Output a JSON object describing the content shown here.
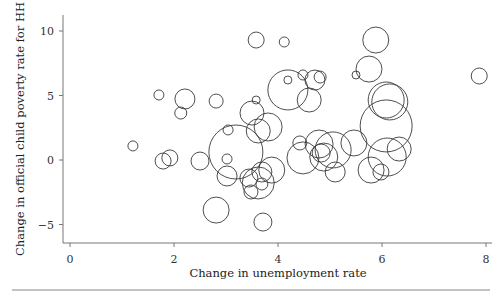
{
  "chart_data": {
    "type": "scatter",
    "subtype": "bubble",
    "title": "",
    "xlabel": "Change in unemployment rate",
    "ylabel": "Change in official child poverty rate for HH",
    "xlim": [
      -0.1,
      8.1
    ],
    "ylim": [
      -6.5,
      11
    ],
    "xticks": [
      0,
      2,
      4,
      6,
      8
    ],
    "yticks": [
      -5,
      0,
      5,
      10
    ],
    "grid": false,
    "legend": null,
    "points": [
      {
        "x": 1.21,
        "y": 1.09,
        "r": 5
      },
      {
        "x": 1.71,
        "y": 5.04,
        "r": 5
      },
      {
        "x": 2.21,
        "y": 4.73,
        "r": 10
      },
      {
        "x": 2.13,
        "y": 3.64,
        "r": 6
      },
      {
        "x": 2.81,
        "y": 4.57,
        "r": 7
      },
      {
        "x": 1.79,
        "y": -0.08,
        "r": 8
      },
      {
        "x": 1.92,
        "y": 0.16,
        "r": 8
      },
      {
        "x": 2.5,
        "y": -0.08,
        "r": 9
      },
      {
        "x": 2.81,
        "y": -3.88,
        "r": 13
      },
      {
        "x": 3.02,
        "y": 0.08,
        "r": 5
      },
      {
        "x": 3.02,
        "y": -1.24,
        "r": 10
      },
      {
        "x": 3.04,
        "y": 2.33,
        "r": 5
      },
      {
        "x": 3.19,
        "y": 0.62,
        "r": 27
      },
      {
        "x": 3.62,
        "y": 2.25,
        "r": 12
      },
      {
        "x": 3.5,
        "y": 3.64,
        "r": 12
      },
      {
        "x": 3.58,
        "y": 4.65,
        "r": 4
      },
      {
        "x": 3.58,
        "y": 9.3,
        "r": 8
      },
      {
        "x": 4.12,
        "y": 9.15,
        "r": 5
      },
      {
        "x": 4.19,
        "y": 5.43,
        "r": 20
      },
      {
        "x": 3.81,
        "y": 2.56,
        "r": 14
      },
      {
        "x": 3.44,
        "y": -1.4,
        "r": 9
      },
      {
        "x": 3.48,
        "y": -2.48,
        "r": 7
      },
      {
        "x": 3.62,
        "y": -1.78,
        "r": 16
      },
      {
        "x": 3.69,
        "y": -0.93,
        "r": 10
      },
      {
        "x": 3.88,
        "y": -0.78,
        "r": 13
      },
      {
        "x": 3.71,
        "y": -4.81,
        "r": 9
      },
      {
        "x": 3.69,
        "y": -1.86,
        "r": 6
      },
      {
        "x": 4.19,
        "y": 6.2,
        "r": 4
      },
      {
        "x": 4.48,
        "y": 6.59,
        "r": 5
      },
      {
        "x": 4.71,
        "y": 6.2,
        "r": 10
      },
      {
        "x": 4.81,
        "y": 6.43,
        "r": 6
      },
      {
        "x": 4.6,
        "y": 4.65,
        "r": 12
      },
      {
        "x": 4.42,
        "y": 1.32,
        "r": 7
      },
      {
        "x": 4.48,
        "y": 0.16,
        "r": 16
      },
      {
        "x": 4.79,
        "y": 1.24,
        "r": 14
      },
      {
        "x": 4.88,
        "y": 0.23,
        "r": 14
      },
      {
        "x": 5.06,
        "y": 0.78,
        "r": 18
      },
      {
        "x": 4.83,
        "y": 0.54,
        "r": 9
      },
      {
        "x": 5.1,
        "y": -0.93,
        "r": 10
      },
      {
        "x": 5.5,
        "y": 6.59,
        "r": 4
      },
      {
        "x": 5.75,
        "y": 7.05,
        "r": 13
      },
      {
        "x": 5.88,
        "y": 9.3,
        "r": 13
      },
      {
        "x": 5.46,
        "y": 1.32,
        "r": 13
      },
      {
        "x": 6.08,
        "y": 4.65,
        "r": 18
      },
      {
        "x": 6.15,
        "y": 4.5,
        "r": 18
      },
      {
        "x": 6.08,
        "y": 2.64,
        "r": 26
      },
      {
        "x": 6.1,
        "y": 0.23,
        "r": 19
      },
      {
        "x": 6.33,
        "y": 0.85,
        "r": 12
      },
      {
        "x": 5.79,
        "y": -0.78,
        "r": 13
      },
      {
        "x": 5.98,
        "y": -0.93,
        "r": 8
      },
      {
        "x": 7.87,
        "y": 6.51,
        "r": 8
      }
    ]
  },
  "layout": {
    "plot_left": 63,
    "plot_top": 15,
    "plot_bottom": 243,
    "plot_right": 492,
    "x0_px": 70,
    "px_per_x": 52,
    "y0_px": 160,
    "px_per_y": 12.9,
    "bottom_rule_y": 290,
    "stroke_color": "#3a3a3a",
    "axis_color": "#777777"
  }
}
